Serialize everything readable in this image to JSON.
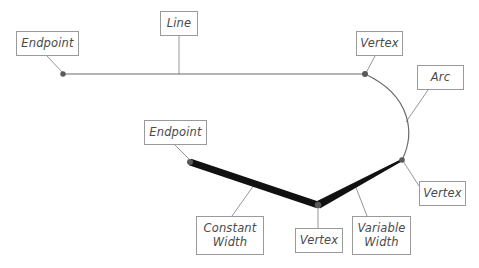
{
  "diagram": {
    "background_color": "#ffffff",
    "thin_stroke_color": "#6b6b6b",
    "leader_stroke_color": "#8a8a8a",
    "thick_stroke_color": "#111111",
    "node_color": "#58595b",
    "box_border_color": "#9a9a9a",
    "text_color": "#4a4a4a"
  },
  "labels": [
    {
      "id": "endpoint-top-left",
      "text": "Endpoint",
      "x": 16,
      "y": 31,
      "w": 63,
      "h": 25
    },
    {
      "id": "line",
      "text": "Line",
      "x": 160,
      "y": 11,
      "w": 38,
      "h": 25
    },
    {
      "id": "vertex-top-right",
      "text": "Vertex",
      "x": 356,
      "y": 31,
      "w": 47,
      "h": 25
    },
    {
      "id": "arc",
      "text": "Arc",
      "x": 417,
      "y": 65,
      "w": 47,
      "h": 25
    },
    {
      "id": "endpoint-lower-left",
      "text": "Endpoint",
      "x": 144,
      "y": 120,
      "w": 63,
      "h": 25
    },
    {
      "id": "vertex-right",
      "text": "Vertex",
      "x": 419,
      "y": 181,
      "w": 47,
      "h": 25
    },
    {
      "id": "constant-width",
      "text": "Constant\nWidth",
      "x": 196,
      "y": 216,
      "w": 68,
      "h": 39
    },
    {
      "id": "vertex-bottom",
      "text": "Vertex",
      "x": 295,
      "y": 228,
      "w": 48,
      "h": 25
    },
    {
      "id": "variable-width",
      "text": "Variable\nWidth",
      "x": 352,
      "y": 216,
      "w": 59,
      "h": 39
    }
  ],
  "geometry": {
    "line_segment": {
      "from_x": 63,
      "from_y": 74,
      "to_x": 365,
      "to_y": 74
    },
    "arc": {
      "start_x": 365,
      "start_y": 74,
      "end_x": 402,
      "end_y": 160,
      "bulge_x": 412
    },
    "constant_width_segment": {
      "from_x": 190,
      "from_y": 162,
      "to_x": 318,
      "to_y": 205,
      "width": 7
    },
    "variable_width_segment": {
      "from_x": 318,
      "from_y": 205,
      "to_x": 402,
      "to_y": 160,
      "from_width": 8,
      "to_width": 2
    },
    "nodes": [
      {
        "id": "endpoint-line-left",
        "x": 63,
        "y": 74,
        "r": 2.7
      },
      {
        "id": "vertex-line-arc",
        "x": 365,
        "y": 74,
        "r": 3.0
      },
      {
        "id": "vertex-arc-polyline",
        "x": 402,
        "y": 160,
        "r": 2.8
      },
      {
        "id": "endpoint-polyline-left",
        "x": 190,
        "y": 162,
        "r": 3.0
      },
      {
        "id": "vertex-polyline-mid",
        "x": 318,
        "y": 205,
        "r": 3.2
      }
    ],
    "leaders": [
      {
        "id": "leader-endpoint-top-left",
        "x1": 47,
        "y1": 56,
        "x2": 63,
        "y2": 73
      },
      {
        "id": "leader-line",
        "x1": 179,
        "y1": 36,
        "x2": 179,
        "y2": 74
      },
      {
        "id": "leader-vertex-top-right",
        "x1": 375,
        "y1": 56,
        "x2": 366,
        "y2": 73
      },
      {
        "id": "leader-arc",
        "x1": 428,
        "y1": 90,
        "x2": 406,
        "y2": 122
      },
      {
        "id": "leader-endpoint-lower-left",
        "x1": 175,
        "y1": 145,
        "x2": 191,
        "y2": 161
      },
      {
        "id": "leader-vertex-right",
        "x1": 419,
        "y1": 186,
        "x2": 403,
        "y2": 161
      },
      {
        "id": "leader-constant-width",
        "x1": 232,
        "y1": 216,
        "x2": 254,
        "y2": 185
      },
      {
        "id": "leader-vertex-bottom",
        "x1": 318,
        "y1": 228,
        "x2": 318,
        "y2": 206
      },
      {
        "id": "leader-variable-width",
        "x1": 367,
        "y1": 216,
        "x2": 355,
        "y2": 185
      }
    ]
  }
}
